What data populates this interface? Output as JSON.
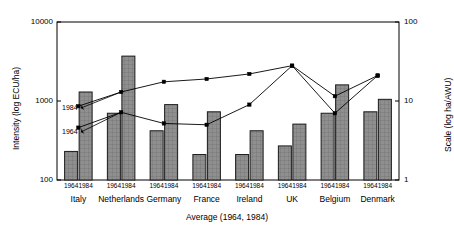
{
  "chart_data": {
    "type": "bar",
    "title": "",
    "xlabel": "Average (1964, 1984)",
    "ylabel": "Intensity (log ECU/ha)",
    "y2label": "Scale (log ha/AWU)",
    "ylim": [
      100,
      10000
    ],
    "y2lim": [
      1,
      100
    ],
    "yscale": "log",
    "y2scale": "log",
    "grid": false,
    "legend": "none",
    "ytick_labels": [
      "10000",
      "1000",
      "100"
    ],
    "ytick_values": [
      10000,
      1000,
      100
    ],
    "y2tick_labels": [
      "100",
      "10",
      "1"
    ],
    "y2tick_values": [
      100,
      10,
      1
    ],
    "categories": [
      "Italy",
      "Netherlands",
      "Germany",
      "France",
      "Ireland",
      "UK",
      "Belgium",
      "Denmark"
    ],
    "subcategories": [
      "1964",
      "1984"
    ],
    "bar_series": [
      {
        "name": "1964",
        "axis": "left",
        "units": "ECU/ha",
        "values": [
          230,
          700,
          420,
          210,
          210,
          270,
          700,
          730
        ]
      },
      {
        "name": "1984",
        "axis": "left",
        "units": "ECU/ha",
        "values": [
          1300,
          3700,
          900,
          730,
          420,
          510,
          1600,
          1050
        ]
      }
    ],
    "line_series": [
      {
        "name": "1984",
        "axis": "right",
        "units": "ha/AWU",
        "marker": "square",
        "values": [
          8.6,
          13.0,
          17.5,
          19.0,
          22.0,
          28.0,
          7.0,
          21.0
        ]
      },
      {
        "name": "1964",
        "axis": "right",
        "units": "ha/AWU",
        "marker": "square",
        "values": [
          4.6,
          7.2,
          5.2,
          5.0,
          9.0,
          28.0,
          11.5,
          21.0
        ]
      }
    ],
    "annotations": [
      {
        "text": "1984",
        "points_to_series": "1984"
      },
      {
        "text": "1964",
        "points_to_series": "1964"
      }
    ]
  },
  "style": {
    "bar_fill": "#8c8c8c",
    "bar_edge": "#1a1a1a",
    "line_color": "#000000",
    "axis_color": "#000000",
    "background": "#ffffff"
  }
}
